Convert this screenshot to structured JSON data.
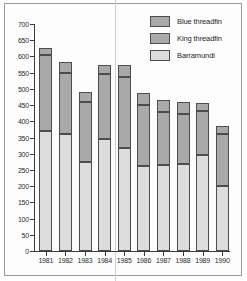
{
  "chart_data": {
    "type": "bar",
    "subtype": "stacked",
    "title": "",
    "xlabel": "",
    "ylabel": "",
    "categories": [
      "1981",
      "1982",
      "1983",
      "1984",
      "1985",
      "1986",
      "1987",
      "1988",
      "1989",
      "1990"
    ],
    "series": [
      {
        "name": "Barramundi",
        "color": "#dcdcdc",
        "values": [
          370,
          360,
          275,
          345,
          318,
          262,
          265,
          268,
          295,
          200
        ]
      },
      {
        "name": "King threadfin",
        "color": "#a9a9a9",
        "values": [
          235,
          190,
          183,
          200,
          220,
          187,
          165,
          155,
          138,
          160
        ]
      },
      {
        "name": "Blue threadfin",
        "color": "#a9a9a9",
        "values": [
          20,
          32,
          32,
          28,
          35,
          39,
          37,
          36,
          22,
          25
        ]
      }
    ],
    "stack_order_bottom_to_top": [
      "Barramundi",
      "King threadfin",
      "Blue threadfin"
    ],
    "totals": [
      625,
      582,
      490,
      573,
      573,
      488,
      467,
      459,
      455,
      385
    ],
    "ylim": [
      0,
      700
    ],
    "ytick_step": 50,
    "yticks": [
      0,
      50,
      100,
      150,
      200,
      250,
      300,
      350,
      400,
      450,
      500,
      550,
      600,
      650,
      700
    ],
    "ytick_labels": [
      "0",
      "50",
      "100",
      "150",
      "200",
      "250",
      "300",
      "350",
      "400",
      "450",
      "500",
      "550",
      "600",
      "650",
      "700"
    ],
    "grid": false,
    "legend_position": "top-right",
    "legend_entries": [
      {
        "label": "Blue threadfin",
        "color": "#a9a9a9"
      },
      {
        "label": "King threadfin",
        "color": "#a9a9a9"
      },
      {
        "label": "Barramundi",
        "color": "#dcdcdc"
      }
    ],
    "axis_color": "#3a3a3a",
    "bar_edge_color": "#4d4d4d",
    "background": "#ffffff"
  }
}
